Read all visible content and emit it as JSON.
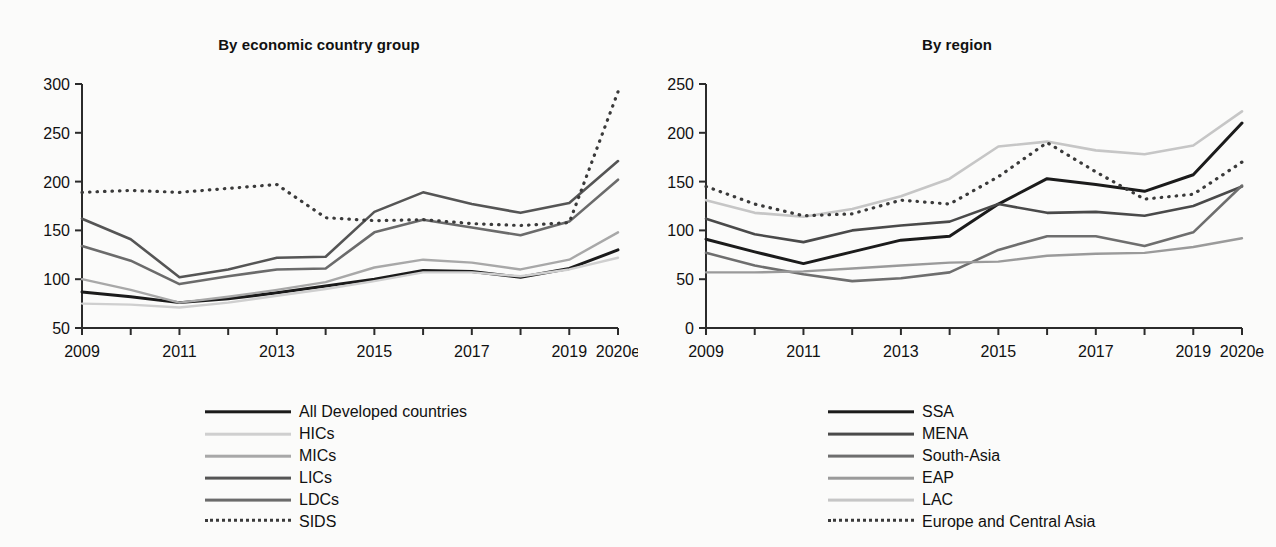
{
  "figure": {
    "background_color": "#fbfbfa",
    "panels": [
      {
        "id": "by-economic-country-group",
        "title": "By economic country group"
      },
      {
        "id": "by-region",
        "title": "By region"
      }
    ]
  },
  "chart_data": [
    {
      "type": "line",
      "title": "By economic country group",
      "xlabel": "",
      "ylabel": "",
      "grid": false,
      "legend_position": "bottom",
      "x": [
        "2009",
        "2010",
        "2011",
        "2012",
        "2013",
        "2014",
        "2015",
        "2016",
        "2017",
        "2018",
        "2019",
        "2020e"
      ],
      "xtick_labels": [
        "2009",
        "",
        "2011",
        "",
        "2013",
        "",
        "2015",
        "",
        "2017",
        "",
        "2019",
        "2020e"
      ],
      "ytick_labels": [
        "50",
        "100",
        "150",
        "200",
        "250",
        "300"
      ],
      "ylim": [
        50,
        300
      ],
      "ytick_step": 50,
      "series": [
        {
          "name": "All Developed countries",
          "color": "#1b1b1b",
          "width": 3.0,
          "dashed": false,
          "values": [
            87,
            82,
            76,
            80,
            86,
            93,
            100,
            109,
            108,
            102,
            111,
            130
          ]
        },
        {
          "name": "HICs",
          "color": "#cfcfcf",
          "width": 2.4,
          "dashed": false,
          "values": [
            75,
            74,
            71,
            76,
            83,
            90,
            98,
            107,
            107,
            103,
            110,
            122
          ]
        },
        {
          "name": "MICs",
          "color": "#a8a8a8",
          "width": 2.4,
          "dashed": false,
          "values": [
            100,
            89,
            76,
            82,
            89,
            97,
            112,
            120,
            117,
            110,
            120,
            148
          ]
        },
        {
          "name": "LICs",
          "color": "#555555",
          "width": 2.6,
          "dashed": false,
          "values": [
            162,
            141,
            102,
            110,
            122,
            123,
            169,
            189,
            177,
            168,
            178,
            221
          ]
        },
        {
          "name": "LDCs",
          "color": "#6b6b6b",
          "width": 2.6,
          "dashed": false,
          "values": [
            134,
            119,
            95,
            103,
            110,
            111,
            148,
            161,
            153,
            145,
            159,
            202
          ]
        },
        {
          "name": "SIDS",
          "color": "#3a3a3a",
          "width": 3.2,
          "dashed": true,
          "values": [
            189,
            191,
            189,
            193,
            197,
            163,
            160,
            161,
            157,
            155,
            158,
            292
          ]
        }
      ]
    },
    {
      "type": "line",
      "title": "By region",
      "xlabel": "",
      "ylabel": "",
      "grid": false,
      "legend_position": "bottom",
      "x": [
        "2009",
        "2010",
        "2011",
        "2012",
        "2013",
        "2014",
        "2015",
        "2016",
        "2017",
        "2018",
        "2019",
        "2020e"
      ],
      "xtick_labels": [
        "2009",
        "",
        "2011",
        "",
        "2013",
        "",
        "2015",
        "",
        "2017",
        "",
        "2019",
        "2020e"
      ],
      "ytick_labels": [
        "0",
        "50",
        "100",
        "150",
        "200",
        "250"
      ],
      "ylim": [
        0,
        250
      ],
      "ytick_step": 50,
      "series": [
        {
          "name": "SSA",
          "color": "#1b1b1b",
          "width": 3.0,
          "dashed": false,
          "values": [
            91,
            78,
            66,
            78,
            90,
            94,
            127,
            153,
            147,
            140,
            157,
            210
          ]
        },
        {
          "name": "MENA",
          "color": "#4a4a4a",
          "width": 2.6,
          "dashed": false,
          "values": [
            112,
            96,
            88,
            100,
            105,
            109,
            127,
            118,
            119,
            115,
            125,
            145
          ]
        },
        {
          "name": "South-Asia",
          "color": "#6e6e6e",
          "width": 2.6,
          "dashed": false,
          "values": [
            77,
            64,
            55,
            48,
            51,
            57,
            80,
            94,
            94,
            84,
            98,
            146
          ]
        },
        {
          "name": "EAP",
          "color": "#9a9a9a",
          "width": 2.4,
          "dashed": false,
          "values": [
            57,
            57,
            58,
            61,
            64,
            67,
            68,
            74,
            76,
            77,
            83,
            92
          ]
        },
        {
          "name": "LAC",
          "color": "#c6c6c6",
          "width": 2.6,
          "dashed": false,
          "values": [
            131,
            118,
            114,
            122,
            135,
            153,
            186,
            191,
            182,
            178,
            187,
            222
          ]
        },
        {
          "name": "Europe and Central Asia",
          "color": "#3a3a3a",
          "width": 3.2,
          "dashed": true,
          "values": [
            145,
            127,
            115,
            117,
            131,
            127,
            155,
            190,
            160,
            132,
            137,
            170
          ]
        }
      ]
    }
  ],
  "legends": [
    {
      "items": [
        {
          "label": "All Developed countries",
          "color": "#1b1b1b",
          "width": 3.4,
          "dashed": false
        },
        {
          "label": "HICs",
          "color": "#cfcfcf",
          "width": 2.6,
          "dashed": false
        },
        {
          "label": "MICs",
          "color": "#a8a8a8",
          "width": 2.6,
          "dashed": false
        },
        {
          "label": "LICs",
          "color": "#555555",
          "width": 2.8,
          "dashed": false
        },
        {
          "label": "LDCs",
          "color": "#6b6b6b",
          "width": 2.8,
          "dashed": false
        },
        {
          "label": "SIDS",
          "color": "#3a3a3a",
          "width": 3.4,
          "dashed": true
        }
      ]
    },
    {
      "items": [
        {
          "label": "SSA",
          "color": "#1b1b1b",
          "width": 3.4,
          "dashed": false
        },
        {
          "label": "MENA",
          "color": "#4a4a4a",
          "width": 2.8,
          "dashed": false
        },
        {
          "label": "South-Asia",
          "color": "#6e6e6e",
          "width": 2.8,
          "dashed": false
        },
        {
          "label": "EAP",
          "color": "#9a9a9a",
          "width": 2.6,
          "dashed": false
        },
        {
          "label": "LAC",
          "color": "#c6c6c6",
          "width": 2.8,
          "dashed": false
        },
        {
          "label": "Europe and Central Asia",
          "color": "#3a3a3a",
          "width": 3.4,
          "dashed": true
        }
      ]
    }
  ]
}
